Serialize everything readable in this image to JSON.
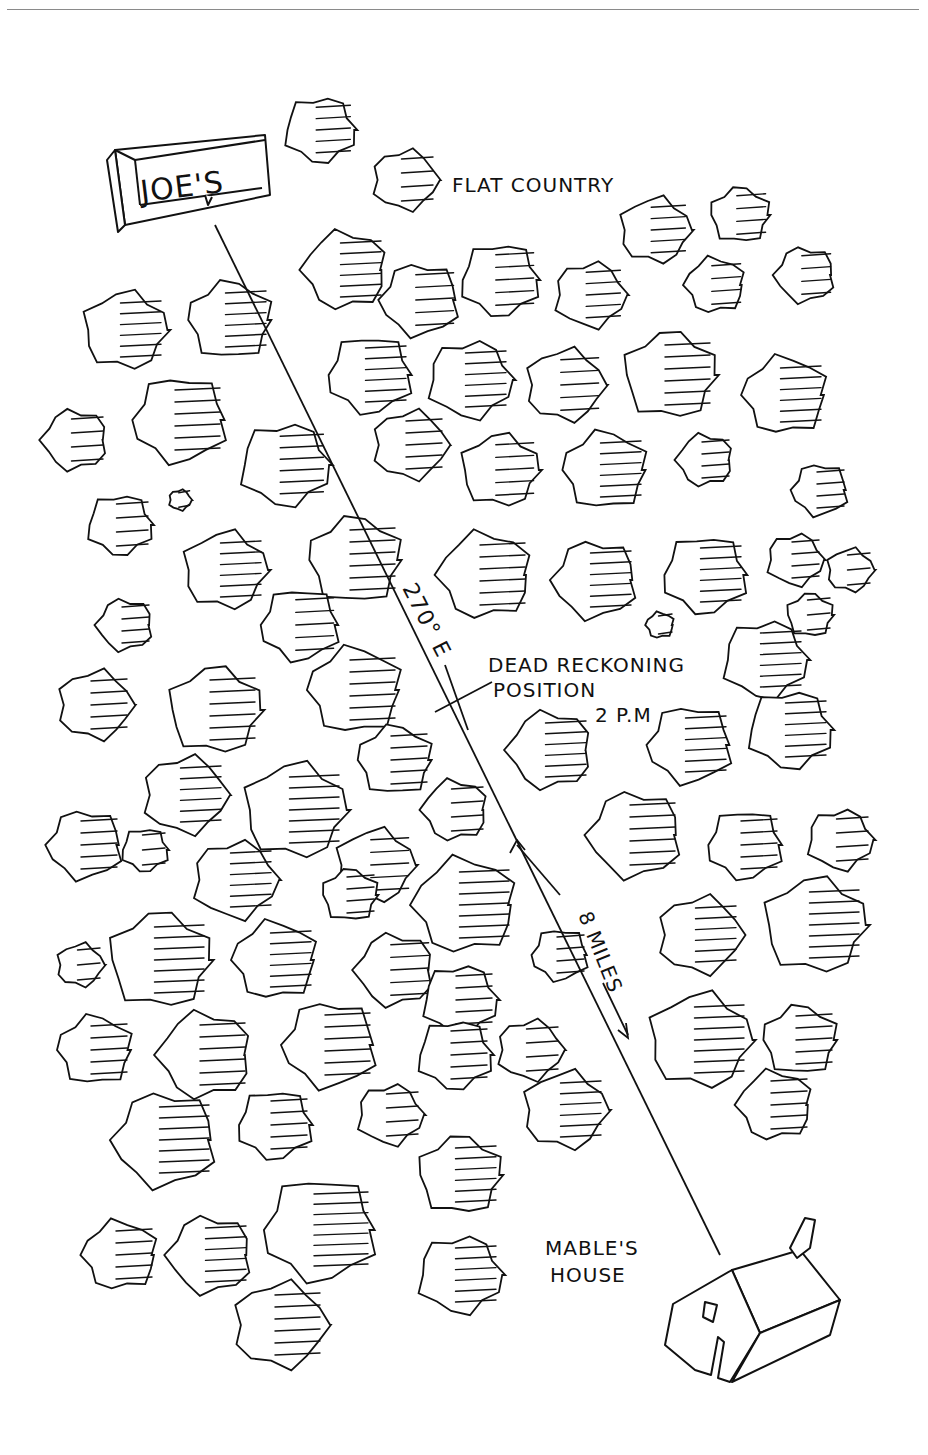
{
  "map": {
    "labels": {
      "start_sign": "JOE'S",
      "terrain": "FLAT COUNTRY",
      "bearing": "270° E",
      "dr_line1": "DEAD RECKONING",
      "dr_line2": "POSITION",
      "dr_time": "2 P.M",
      "distance": "8 MILES",
      "dest_line1": "MABLE'S",
      "dest_line2": "HOUSE"
    },
    "colors": {
      "ink": "#111111",
      "paper": "#ffffff",
      "rule": "#8a8a8a"
    },
    "route": {
      "from": [
        215,
        225
      ],
      "to": [
        720,
        1255
      ]
    },
    "trees": [
      [
        320,
        130,
        38
      ],
      [
        405,
        180,
        35
      ],
      [
        125,
        330,
        45
      ],
      [
        230,
        320,
        45
      ],
      [
        345,
        270,
        45
      ],
      [
        420,
        300,
        42
      ],
      [
        500,
        280,
        42
      ],
      [
        590,
        295,
        38
      ],
      [
        655,
        230,
        38
      ],
      [
        740,
        215,
        32
      ],
      [
        715,
        285,
        32
      ],
      [
        805,
        275,
        32
      ],
      [
        370,
        375,
        45
      ],
      [
        470,
        380,
        45
      ],
      [
        565,
        385,
        42
      ],
      [
        670,
        375,
        50
      ],
      [
        785,
        395,
        45
      ],
      [
        75,
        440,
        35
      ],
      [
        180,
        420,
        50
      ],
      [
        285,
        465,
        48
      ],
      [
        410,
        445,
        40
      ],
      [
        500,
        470,
        42
      ],
      [
        605,
        470,
        45
      ],
      [
        705,
        460,
        30
      ],
      [
        820,
        490,
        30
      ],
      [
        120,
        525,
        35
      ],
      [
        180,
        500,
        12
      ],
      [
        225,
        570,
        45
      ],
      [
        355,
        560,
        50
      ],
      [
        485,
        575,
        50
      ],
      [
        595,
        580,
        45
      ],
      [
        705,
        575,
        45
      ],
      [
        795,
        560,
        30
      ],
      [
        850,
        570,
        25
      ],
      [
        810,
        615,
        25
      ],
      [
        660,
        625,
        15
      ],
      [
        125,
        625,
        30
      ],
      [
        300,
        625,
        42
      ],
      [
        765,
        660,
        45
      ],
      [
        95,
        705,
        40
      ],
      [
        215,
        710,
        50
      ],
      [
        355,
        690,
        50
      ],
      [
        550,
        750,
        45
      ],
      [
        690,
        745,
        45
      ],
      [
        790,
        730,
        45
      ],
      [
        185,
        795,
        45
      ],
      [
        295,
        810,
        55
      ],
      [
        395,
        760,
        40
      ],
      [
        455,
        810,
        35
      ],
      [
        85,
        845,
        40
      ],
      [
        145,
        850,
        25
      ],
      [
        235,
        880,
        45
      ],
      [
        375,
        865,
        42
      ],
      [
        350,
        895,
        30
      ],
      [
        465,
        905,
        55
      ],
      [
        635,
        835,
        50
      ],
      [
        745,
        845,
        40
      ],
      [
        840,
        840,
        35
      ],
      [
        80,
        965,
        25
      ],
      [
        160,
        960,
        55
      ],
      [
        275,
        960,
        45
      ],
      [
        395,
        970,
        42
      ],
      [
        560,
        955,
        30
      ],
      [
        460,
        1000,
        40
      ],
      [
        700,
        935,
        45
      ],
      [
        815,
        925,
        55
      ],
      [
        95,
        1050,
        40
      ],
      [
        205,
        1055,
        50
      ],
      [
        330,
        1045,
        50
      ],
      [
        455,
        1055,
        40
      ],
      [
        530,
        1050,
        35
      ],
      [
        700,
        1040,
        55
      ],
      [
        800,
        1040,
        40
      ],
      [
        775,
        1105,
        40
      ],
      [
        165,
        1140,
        55
      ],
      [
        275,
        1125,
        40
      ],
      [
        390,
        1115,
        35
      ],
      [
        565,
        1110,
        45
      ],
      [
        460,
        1175,
        45
      ],
      [
        120,
        1255,
        40
      ],
      [
        210,
        1255,
        45
      ],
      [
        320,
        1230,
        60
      ],
      [
        460,
        1275,
        45
      ],
      [
        280,
        1325,
        50
      ]
    ]
  }
}
